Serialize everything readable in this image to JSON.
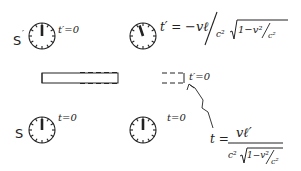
{
  "diagram": {
    "frames": {
      "primed": {
        "label": "S",
        "prime": "′"
      },
      "unprimed": {
        "label": "S",
        "prime": ""
      }
    },
    "clocks": [
      {
        "id": "top-left",
        "frame": "S′",
        "label": "t′=0",
        "hand_angle_deg": 0
      },
      {
        "id": "top-right",
        "frame": "S′",
        "label": "",
        "hand_angle_deg": -18
      },
      {
        "id": "bottom-left",
        "frame": "S",
        "label": "t=0",
        "hand_angle_deg": 0
      },
      {
        "id": "bottom-right",
        "frame": "S",
        "label": "t=0",
        "hand_angle_deg": 0
      }
    ],
    "rod": {
      "end_label": "t′=0"
    },
    "formulas": {
      "top": {
        "lhs": "t′ =",
        "numerator": "−vℓ",
        "denom_c2": "c²",
        "root_content": "1−v²",
        "root_denom": "c²"
      },
      "bottom": {
        "lhs": "t =",
        "numerator": "vℓ′",
        "denom_c2": "c²",
        "root_content": "1−v²",
        "root_denom": "c²"
      }
    }
  },
  "colors": {
    "ink": "#222222",
    "background": "#ffffff"
  }
}
